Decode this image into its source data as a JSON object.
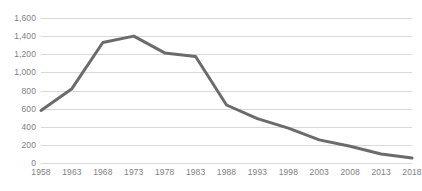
{
  "chart_data": {
    "type": "line",
    "title": "",
    "subtitle": "",
    "xlabel": "",
    "ylabel": "",
    "categories": [
      "1958",
      "1963",
      "1968",
      "1973",
      "1978",
      "1983",
      "1988",
      "1993",
      "1998",
      "2003",
      "2008",
      "2013",
      "2018"
    ],
    "x": [
      1958,
      1963,
      1968,
      1973,
      1978,
      1983,
      1988,
      1993,
      1998,
      2003,
      2008,
      2013,
      2018
    ],
    "values": [
      580,
      820,
      1330,
      1400,
      1215,
      1175,
      640,
      490,
      385,
      255,
      185,
      100,
      55
    ],
    "series": [
      {
        "name": "",
        "values": [
          580,
          820,
          1330,
          1400,
          1215,
          1175,
          640,
          490,
          385,
          255,
          185,
          100,
          55
        ],
        "color": "#6b6b6b"
      }
    ],
    "ylim": [
      0,
      1600
    ],
    "xlim": [
      1958,
      2018
    ],
    "y_ticks": [
      0,
      200,
      400,
      600,
      800,
      1000,
      1200,
      1400,
      1600
    ],
    "y_tick_labels": [
      "0",
      "200",
      "400",
      "600",
      "800",
      "1,000",
      "1,200",
      "1,400",
      "1,600"
    ],
    "x_tick_labels": [
      "1958",
      "1963",
      "1968",
      "1973",
      "1978",
      "1983",
      "1988",
      "1993",
      "1998",
      "2003",
      "2008",
      "2013",
      "2018"
    ],
    "grid": true,
    "grid_axis": "y",
    "legend": false,
    "legend_position": "none",
    "annotations": [],
    "colors": {
      "line": "#6b6b6b",
      "gridline": "#d9d9d9",
      "tick_label": "#7f7f7f",
      "background": "#ffffff"
    },
    "line_width": 3
  }
}
